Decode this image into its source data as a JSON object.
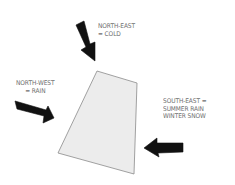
{
  "diagram": {
    "site": {
      "shape": "trapezoid",
      "fill": "#ececec",
      "stroke": "#8a8a8a",
      "points": [
        [
          97,
          71
        ],
        [
          137,
          83
        ],
        [
          134,
          174
        ],
        [
          58,
          153
        ]
      ]
    },
    "arrow_color": "#111111",
    "text_color": "#6e6e6e",
    "winds": [
      {
        "direction": "North-East",
        "label_line1": "NORTH-EAST",
        "label_line2": "= COLD",
        "arrow_icon": "arrow-down-right-icon"
      },
      {
        "direction": "North-West",
        "label_line1": "NORTH-WEST",
        "label_line2": "= RAIN",
        "arrow_icon": "arrow-right-icon"
      },
      {
        "direction": "South-East",
        "label_line1": "SOUTH-EAST =",
        "label_line2": "SUMMER RAIN",
        "label_line3": "WINTER SNOW",
        "arrow_icon": "arrow-left-icon"
      }
    ]
  }
}
